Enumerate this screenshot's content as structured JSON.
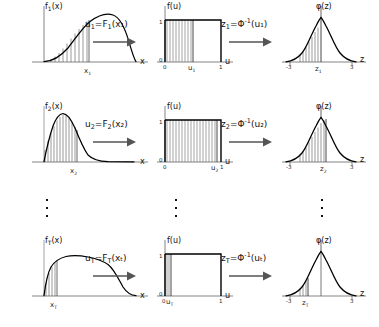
{
  "figure": {
    "type": "diagram",
    "rows": [
      {
        "id": "row-1",
        "index": "1",
        "left_panel": {
          "ylabel": "f₁(x)",
          "ylabel_base": "f",
          "ylabel_sub": "1",
          "ylabel_tail": "(x)",
          "xlabel": "x",
          "marker_label": "x₁",
          "marker_base": "x",
          "marker_sub": "1",
          "curve": "right-skewed unimodal",
          "marker_pos_frac": 0.52,
          "shade_from_frac": 0.0
        },
        "arrow_1": {
          "label_lhs": "u₁",
          "label_lhs_base": "u",
          "label_lhs_sub": "1",
          "label_rhs_base": "F",
          "label_rhs_sub": "1",
          "label_rhs_arg": "(x₁)",
          "label_full": "u₁=F₁(x₁)",
          "glyph": "right-arrow"
        },
        "mid_panel": {
          "ylabel": "f(u)",
          "xlabel": "u",
          "tick_left": "0",
          "tick_right": "1",
          "tick_top": "1",
          "tick_origin": "0",
          "marker_label": "u₁",
          "marker_base": "u",
          "marker_sub": "1",
          "marker_pos_frac": 0.46
        },
        "arrow_2": {
          "label_full": "z₁=Φ⁻¹(u₁)",
          "label_lhs_base": "z",
          "label_lhs_sub": "1",
          "label_phi": "Φ",
          "label_sup": "-1",
          "label_arg": "(u₁)",
          "glyph": "right-arrow"
        },
        "right_panel": {
          "ylabel": "φ(z)",
          "xlabel": "z",
          "tick_left": "-3",
          "tick_right": "3",
          "marker_label": "z₁",
          "marker_base": "z",
          "marker_sub": "1",
          "marker_pos_frac": 0.46,
          "curve": "standard normal"
        }
      },
      {
        "id": "row-2",
        "index": "2",
        "left_panel": {
          "ylabel": "f₂(x)",
          "ylabel_base": "f",
          "ylabel_sub": "2",
          "ylabel_tail": "(x)",
          "xlabel": "x",
          "marker_label": "x₂",
          "marker_base": "x",
          "marker_sub": "2",
          "curve": "sharply right-skewed unimodal",
          "marker_pos_frac": 0.3,
          "shade_from_frac": 0.0
        },
        "arrow_1": {
          "label_lhs_base": "u",
          "label_lhs_sub": "2",
          "label_rhs_base": "F",
          "label_rhs_sub": "2",
          "label_rhs_arg": "(x₂)",
          "label_full": "u₂=F₂(x₂)",
          "glyph": "right-arrow"
        },
        "mid_panel": {
          "ylabel": "f(u)",
          "xlabel": "u",
          "tick_left": "0",
          "tick_right": "1",
          "tick_top": "1",
          "tick_origin": "0",
          "marker_label": "u₂",
          "marker_base": "u",
          "marker_sub": "2",
          "marker_pos_frac": 0.9
        },
        "arrow_2": {
          "label_full": "z₂=Φ⁻¹(u₂)",
          "label_lhs_base": "z",
          "label_lhs_sub": "2",
          "label_phi": "Φ",
          "label_sup": "-1",
          "label_arg": "(u₂)",
          "glyph": "right-arrow"
        },
        "right_panel": {
          "ylabel": "φ(z)",
          "xlabel": "z",
          "tick_left": "-3",
          "tick_right": "3",
          "marker_label": "z₂",
          "marker_base": "z",
          "marker_sub": "2",
          "marker_pos_frac": 0.55,
          "curve": "standard normal"
        }
      },
      {
        "id": "row-3",
        "index": "T",
        "left_panel": {
          "ylabel": "fₜ(x)",
          "ylabel_base": "f",
          "ylabel_sub": "T",
          "ylabel_tail": "(x)",
          "xlabel": "x",
          "marker_label": "xₜ",
          "marker_base": "x",
          "marker_sub": "T",
          "curve": "broad flat-topped",
          "marker_pos_frac": 0.13,
          "shade_from_frac": 0.0
        },
        "arrow_1": {
          "label_lhs_base": "u",
          "label_lhs_sub": "T",
          "label_rhs_base": "F",
          "label_rhs_sub": "T",
          "label_rhs_arg": "(xₜ)",
          "label_full": "uₜ=Fₜ(xₜ)",
          "glyph": "right-arrow"
        },
        "mid_panel": {
          "ylabel": "f(u)",
          "xlabel": "u",
          "tick_left": "0",
          "tick_right": "1",
          "tick_top": "1",
          "tick_origin": "0",
          "marker_label": "uₜ",
          "marker_base": "u",
          "marker_sub": "T",
          "marker_pos_frac": 0.09
        },
        "arrow_2": {
          "label_full": "zₜ=Φ⁻¹(uₜ)",
          "label_lhs_base": "z",
          "label_lhs_sub": "T",
          "label_phi": "Φ",
          "label_sup": "-1",
          "label_arg": "(uₜ)",
          "glyph": "right-arrow"
        },
        "right_panel": {
          "ylabel": "φ(z)",
          "xlabel": "z",
          "tick_left": "-3",
          "tick_right": "3",
          "marker_label": "zₜ",
          "marker_base": "z",
          "marker_sub": "T",
          "marker_pos_frac": 0.22,
          "curve": "standard normal"
        }
      }
    ],
    "ellipsis": {
      "glyph": "vertical-dots",
      "count": 3,
      "columns": [
        "left",
        "middle",
        "right"
      ]
    },
    "colors": {
      "ink": "#111111",
      "curve": "#000000",
      "hatch": "#555555",
      "axis": "#666666",
      "background": "#ffffff"
    }
  }
}
